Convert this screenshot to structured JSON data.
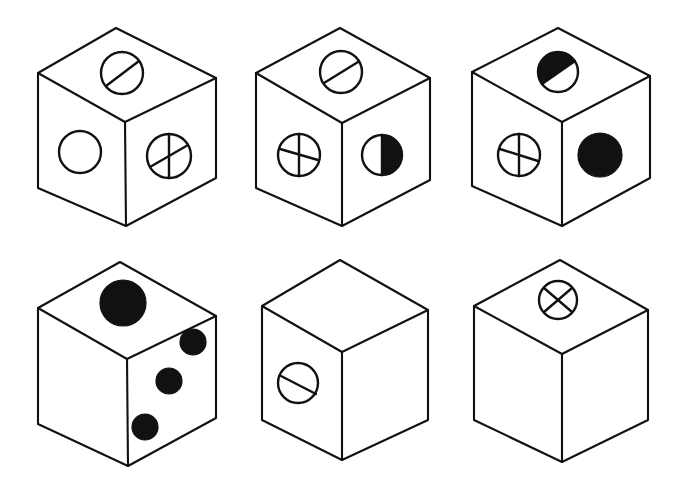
{
  "figure": {
    "background_color": "#ffffff",
    "ink_color": "#111111",
    "canvas": {
      "width": 678,
      "height": 488
    },
    "layout": {
      "rows": 2,
      "columns": 3,
      "count": 6
    },
    "cubes": [
      {
        "id": "cube-1",
        "row": 1,
        "column": 1,
        "position": {
          "x": 30,
          "y": 20,
          "width": 200,
          "height": 215
        },
        "faces": {
          "top": {
            "marking": "circle-with-single-diagonal",
            "fill": "outline"
          },
          "left": {
            "marking": "plain-circle",
            "fill": "outline"
          },
          "right": {
            "marking": "circle-with-cross",
            "fill": "outline"
          }
        }
      },
      {
        "id": "cube-2",
        "row": 1,
        "column": 2,
        "position": {
          "x": 250,
          "y": 20,
          "width": 200,
          "height": 215
        },
        "faces": {
          "top": {
            "marking": "circle-with-single-diagonal",
            "fill": "outline"
          },
          "left": {
            "marking": "circle-with-cross",
            "fill": "outline"
          },
          "right": {
            "marking": "half-filled-circle-right",
            "fill": "half-black"
          }
        }
      },
      {
        "id": "cube-3",
        "row": 1,
        "column": 3,
        "position": {
          "x": 470,
          "y": 20,
          "width": 200,
          "height": 215
        },
        "faces": {
          "top": {
            "marking": "half-filled-circle-upper",
            "fill": "half-black"
          },
          "left": {
            "marking": "circle-with-cross",
            "fill": "outline"
          },
          "right": {
            "marking": "solid-black-circle",
            "fill": "black"
          }
        }
      },
      {
        "id": "cube-4",
        "row": 2,
        "column": 1,
        "position": {
          "x": 30,
          "y": 255,
          "width": 200,
          "height": 215
        },
        "faces": {
          "top": {
            "marking": "solid-black-circle",
            "fill": "black"
          },
          "left": {
            "marking": "blank",
            "fill": "none"
          },
          "right": {
            "marking": "three-black-dots-diagonal",
            "fill": "black",
            "dot_count": 3
          }
        }
      },
      {
        "id": "cube-5",
        "row": 2,
        "column": 2,
        "position": {
          "x": 250,
          "y": 255,
          "width": 200,
          "height": 215
        },
        "faces": {
          "top": {
            "marking": "blank",
            "fill": "none"
          },
          "left": {
            "marking": "circle-with-single-diagonal",
            "fill": "outline"
          },
          "right": {
            "marking": "blank",
            "fill": "none"
          }
        }
      },
      {
        "id": "cube-6",
        "row": 2,
        "column": 3,
        "position": {
          "x": 470,
          "y": 255,
          "width": 200,
          "height": 215
        },
        "faces": {
          "top": {
            "marking": "circle-with-x",
            "fill": "outline"
          },
          "left": {
            "marking": "blank",
            "fill": "none"
          },
          "right": {
            "marking": "blank",
            "fill": "none"
          }
        }
      }
    ]
  }
}
